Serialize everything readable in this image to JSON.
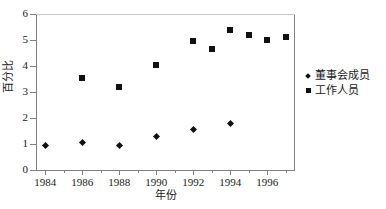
{
  "chart_data": {
    "type": "scatter",
    "title": "",
    "xlabel": "年份",
    "ylabel": "百分比",
    "xlim": [
      1983.5,
      1997.5
    ],
    "ylim": [
      0,
      6
    ],
    "yticks": [
      0,
      1,
      2,
      3,
      4,
      5,
      6
    ],
    "xticks": [
      1984,
      1986,
      1988,
      1990,
      1992,
      1994,
      1996
    ],
    "x_minor_ticks": [
      1985,
      1987,
      1989,
      1991,
      1993,
      1995,
      1997
    ],
    "grid": false,
    "legend_position": "right",
    "series": [
      {
        "name": "董事会成员",
        "marker": "diamond",
        "color": "#111111",
        "points": [
          {
            "x": 1984,
            "y": 0.95
          },
          {
            "x": 1986,
            "y": 1.05
          },
          {
            "x": 1988,
            "y": 0.95
          },
          {
            "x": 1990,
            "y": 1.3
          },
          {
            "x": 1992,
            "y": 1.55
          },
          {
            "x": 1994,
            "y": 1.8
          }
        ]
      },
      {
        "name": "工作人员",
        "marker": "square",
        "color": "#111111",
        "points": [
          {
            "x": 1986,
            "y": 3.55
          },
          {
            "x": 1988,
            "y": 3.2
          },
          {
            "x": 1990,
            "y": 4.05
          },
          {
            "x": 1992,
            "y": 4.95
          },
          {
            "x": 1993,
            "y": 4.65
          },
          {
            "x": 1994,
            "y": 5.4
          },
          {
            "x": 1995,
            "y": 5.2
          },
          {
            "x": 1996,
            "y": 5.0
          },
          {
            "x": 1997,
            "y": 5.1
          }
        ]
      }
    ]
  },
  "axes": {
    "y_tick_labels": [
      "0",
      "1",
      "2",
      "3",
      "4",
      "5",
      "6"
    ],
    "x_tick_labels": [
      "1984",
      "1986",
      "1988",
      "1990",
      "1992",
      "1994",
      "1996"
    ],
    "y_title": "百分比",
    "x_title": "年份"
  },
  "legend": {
    "items": [
      {
        "label": "董事会成员",
        "marker": "diamond"
      },
      {
        "label": "工作人员",
        "marker": "square"
      }
    ]
  }
}
